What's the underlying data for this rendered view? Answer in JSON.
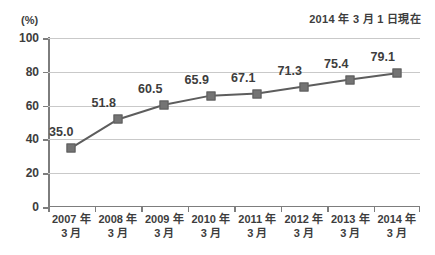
{
  "header": {
    "note": "2014 年 3 月 1 日現在"
  },
  "chart_data": {
    "type": "line",
    "title": "",
    "subtitle": "",
    "annotations": [
      "2014 年 3 月 1 日現在"
    ],
    "xlabel": "",
    "ylabel": "(%)",
    "unit": "(%)",
    "ylim": [
      0,
      100
    ],
    "yticks": [
      0,
      20,
      40,
      60,
      80,
      100
    ],
    "ytick_labels": [
      "0",
      "20",
      "40",
      "60",
      "80",
      "100"
    ],
    "grid": true,
    "legend": "none",
    "categories": [
      "2007 年\n3 月",
      "2008 年\n3 月",
      "2009 年\n3 月",
      "2010 年\n3 月",
      "2011 年\n3 月",
      "2012 年\n3 月",
      "2013 年\n3 月",
      "2014 年\n3 月"
    ],
    "category_lines": [
      {
        "line1": "2007 年",
        "line2": "3 月"
      },
      {
        "line1": "2008 年",
        "line2": "3 月"
      },
      {
        "line1": "2009 年",
        "line2": "3 月"
      },
      {
        "line1": "2010 年",
        "line2": "3 月"
      },
      {
        "line1": "2011 年",
        "line2": "3 月"
      },
      {
        "line1": "2012 年",
        "line2": "3 月"
      },
      {
        "line1": "2013 年",
        "line2": "3 月"
      },
      {
        "line1": "2014 年",
        "line2": "3 月"
      }
    ],
    "values": [
      35.0,
      51.8,
      60.5,
      65.9,
      67.1,
      71.3,
      75.4,
      79.1
    ],
    "value_labels": [
      "35.0",
      "51.8",
      "60.5",
      "65.9",
      "67.1",
      "71.3",
      "75.4",
      "79.1"
    ],
    "series": [
      {
        "name": "",
        "values": [
          35.0,
          51.8,
          60.5,
          65.9,
          67.1,
          71.3,
          75.4,
          79.1
        ],
        "marker": "square",
        "marker_color": "#747474",
        "line_color": "#5d5d5d"
      }
    ],
    "colors": {
      "line": "#5d5d5d",
      "marker": "#747474",
      "grid": "#c9c9c9",
      "axis": "#7d7d7d",
      "text": "#3d3d3d",
      "background": "#ffffff"
    }
  }
}
